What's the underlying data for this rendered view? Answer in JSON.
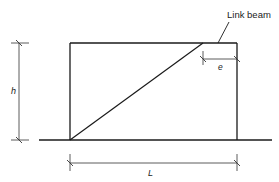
{
  "diagram": {
    "labels": {
      "link_beam": "Link beam",
      "height": "h",
      "length": "L",
      "eccentricity": "e"
    },
    "colors": {
      "line": "#1a1a1a",
      "dim_line": "#333333",
      "background": "#ffffff"
    },
    "elements": [
      {
        "type": "ground-line",
        "description": "base line"
      },
      {
        "type": "left-column"
      },
      {
        "type": "right-column"
      },
      {
        "type": "top-beam"
      },
      {
        "type": "diagonal-brace"
      },
      {
        "type": "link-beam-segment",
        "label": "Link beam"
      },
      {
        "type": "dimension",
        "label": "h",
        "orientation": "vertical"
      },
      {
        "type": "dimension",
        "label": "L",
        "orientation": "horizontal"
      },
      {
        "type": "dimension",
        "label": "e",
        "orientation": "horizontal"
      }
    ]
  }
}
